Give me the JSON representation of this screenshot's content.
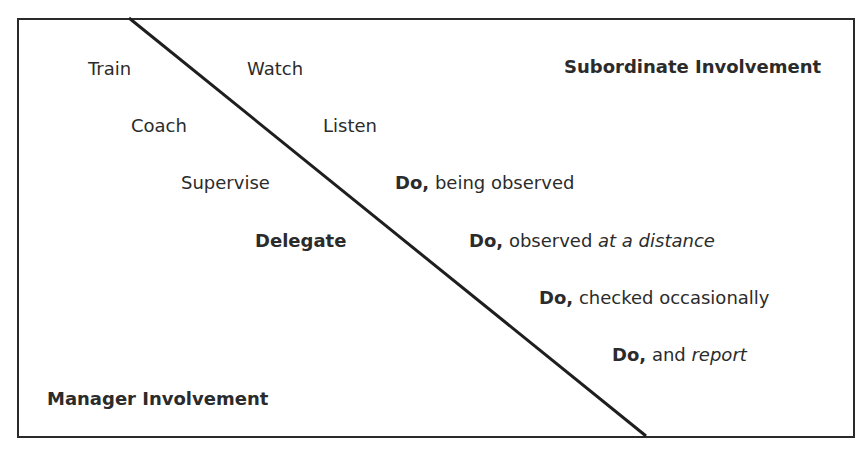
{
  "diagram": {
    "manager_side": {
      "heading": "Manager Involvement",
      "items": [
        "Train",
        "Coach",
        "Supervise",
        "Delegate"
      ]
    },
    "subordinate_side": {
      "heading": "Subordinate Involvement",
      "items": [
        {
          "lead": "Watch"
        },
        {
          "lead": "Listen"
        },
        {
          "lead": "Do,",
          "rest": " being observed",
          "emph": ""
        },
        {
          "lead": "Do,",
          "rest": " observed ",
          "emph": "at a distance"
        },
        {
          "lead": "Do,",
          "rest": " checked occasionally",
          "emph": ""
        },
        {
          "lead": "Do,",
          "rest": " and ",
          "emph": "report"
        }
      ]
    },
    "divider": {
      "from": [
        129,
        18
      ],
      "to": [
        646,
        436
      ],
      "color": "#1e1e1e"
    }
  }
}
